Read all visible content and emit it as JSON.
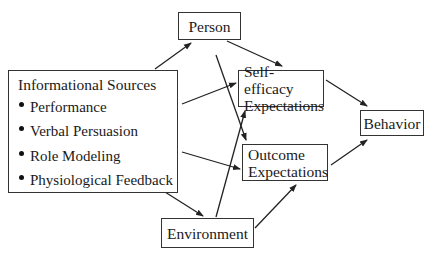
{
  "diagram": {
    "type": "flow-diagram",
    "nodes": {
      "informational_sources": {
        "title": "Informational Sources",
        "items": [
          "Performance",
          "Verbal Persuasion",
          "Role Modeling",
          "Physiological Feedback"
        ]
      },
      "person": {
        "label": "Person"
      },
      "self_efficacy": {
        "line1": "Self-efficacy",
        "line2": "Expectations"
      },
      "outcome": {
        "line1": "Outcome",
        "line2": "Expectations"
      },
      "behavior": {
        "label": "Behavior"
      },
      "environment": {
        "label": "Environment"
      }
    },
    "edges": [
      {
        "from": "Informational Sources",
        "to": "Person"
      },
      {
        "from": "Informational Sources",
        "to": "Self-efficacy Expectations"
      },
      {
        "from": "Informational Sources",
        "to": "Outcome Expectations"
      },
      {
        "from": "Informational Sources",
        "to": "Environment"
      },
      {
        "from": "Person",
        "to": "Self-efficacy Expectations"
      },
      {
        "from": "Person",
        "to": "Outcome Expectations"
      },
      {
        "from": "Environment",
        "to": "Self-efficacy Expectations"
      },
      {
        "from": "Environment",
        "to": "Outcome Expectations"
      },
      {
        "from": "Self-efficacy Expectations",
        "to": "Behavior"
      },
      {
        "from": "Outcome Expectations",
        "to": "Behavior"
      }
    ],
    "colors": {
      "stroke": "#333333",
      "text": "#1a1a1a",
      "background": "#ffffff"
    }
  }
}
